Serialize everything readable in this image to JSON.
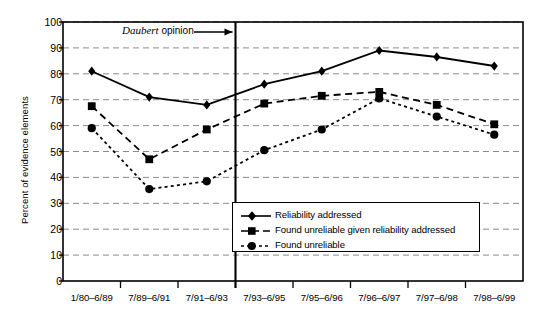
{
  "chart_data": {
    "type": "line",
    "title": "",
    "xlabel": "",
    "ylabel": "Percent of evidence elements",
    "ylim": [
      0,
      100
    ],
    "ytick_step": 10,
    "yticks": [
      0,
      10,
      20,
      30,
      40,
      50,
      60,
      70,
      80,
      90,
      100
    ],
    "grid": "horizontal-dashed",
    "legend_position": "lower-right-inside",
    "categories": [
      "1/80–6/89",
      "7/89–6/91",
      "7/91–6/93",
      "7/93–6/95",
      "7/95–6/96",
      "7/96–6/97",
      "7/97–6/98",
      "7/98–6/99"
    ],
    "series": [
      {
        "name": "Reliability addressed",
        "marker": "diamond",
        "line": "solid",
        "color": "#000000",
        "values": [
          81,
          71,
          68,
          76,
          81,
          89,
          86.5,
          83
        ]
      },
      {
        "name": "Found unreliable given reliability addressed",
        "marker": "square",
        "line": "dashed",
        "color": "#000000",
        "values": [
          67.5,
          47,
          58.5,
          68.5,
          71.5,
          73,
          68,
          60.5
        ]
      },
      {
        "name": "Found unreliable",
        "marker": "circle",
        "line": "dotted",
        "color": "#000000",
        "values": [
          59,
          35.5,
          38.5,
          50.5,
          58.5,
          70.5,
          63.5,
          56.5
        ]
      }
    ],
    "annotations": [
      {
        "text_italic": "Daubert",
        "text_rest": " opinion",
        "arrow": "right-arrow",
        "vline_after_category_index": 2,
        "vline_label": "Daubert opinion"
      }
    ]
  },
  "legend": {
    "items": [
      {
        "label": "Reliability addressed"
      },
      {
        "label": "Found unreliable given reliability addressed"
      },
      {
        "label": "Found unreliable"
      }
    ]
  }
}
